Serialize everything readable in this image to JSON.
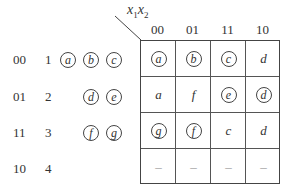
{
  "corner_label": {
    "x1": "x",
    "sub1": "1",
    "x2": "x",
    "sub2": "2"
  },
  "col_headers": [
    "00",
    "01",
    "11",
    "10"
  ],
  "row_headers": [
    "00",
    "01",
    "11",
    "10"
  ],
  "row_numbers": [
    "1",
    "2",
    "3",
    "4"
  ],
  "row_state_groups": [
    [
      "a",
      "b",
      "c"
    ],
    [
      "d",
      "e"
    ],
    [
      "f",
      "g"
    ],
    []
  ],
  "cells": [
    [
      {
        "v": "a",
        "circled": true
      },
      {
        "v": "b",
        "circled": true
      },
      {
        "v": "c",
        "circled": true
      },
      {
        "v": "d",
        "circled": false
      }
    ],
    [
      {
        "v": "a",
        "circled": false
      },
      {
        "v": "f",
        "circled": false
      },
      {
        "v": "e",
        "circled": true
      },
      {
        "v": "d",
        "circled": true
      }
    ],
    [
      {
        "v": "g",
        "circled": true
      },
      {
        "v": "f",
        "circled": true
      },
      {
        "v": "c",
        "circled": false
      },
      {
        "v": "d",
        "circled": false
      }
    ],
    [
      {
        "v": "–",
        "circled": false
      },
      {
        "v": "–",
        "circled": false
      },
      {
        "v": "–",
        "circled": false
      },
      {
        "v": "–",
        "circled": false
      }
    ]
  ]
}
